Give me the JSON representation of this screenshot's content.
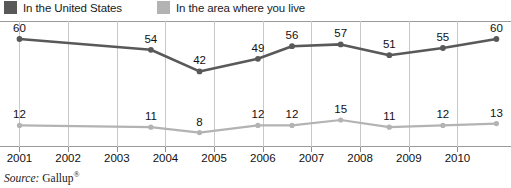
{
  "legend": {
    "items": [
      {
        "label": "In the United States",
        "color": "#595959",
        "icon": "legend-swatch-icon"
      },
      {
        "label": "In the area where you live",
        "color": "#b3b3b3",
        "icon": "legend-swatch-icon"
      }
    ]
  },
  "source": {
    "prefix": "Source:",
    "name": "Gallup",
    "registered_mark": "®"
  },
  "chart_data": {
    "type": "line",
    "title": "",
    "subtitle": "",
    "xlabel": "",
    "ylabel": "",
    "xlim": [
      2000.6,
      2011.1
    ],
    "ylim": [
      0,
      70
    ],
    "grid": "vertical-yearly",
    "legend_position": "top-left",
    "x_tick_labels": [
      "2001",
      "2002",
      "2003",
      "2004",
      "2005",
      "2006",
      "2007",
      "2008",
      "2009",
      "2010"
    ],
    "x_ticks": [
      2001,
      2002,
      2003,
      2004,
      2005,
      2006,
      2007,
      2008,
      2009,
      2010
    ],
    "series": [
      {
        "name": "In the United States",
        "color": "#595959",
        "x": [
          2001.0,
          2003.7,
          2004.7,
          2005.9,
          2006.6,
          2007.6,
          2008.6,
          2009.7,
          2010.8
        ],
        "values": [
          60,
          54,
          42,
          49,
          56,
          57,
          51,
          55,
          60
        ]
      },
      {
        "name": "In the area where you live",
        "color": "#b3b3b3",
        "x": [
          2001.0,
          2003.7,
          2004.7,
          2005.9,
          2006.6,
          2007.6,
          2008.6,
          2009.7,
          2010.8
        ],
        "values": [
          12,
          11,
          8,
          12,
          12,
          15,
          11,
          12,
          13
        ]
      }
    ]
  }
}
